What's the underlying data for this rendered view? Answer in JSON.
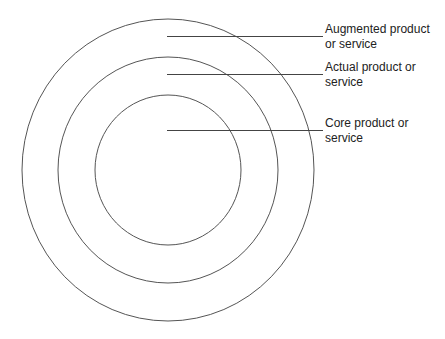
{
  "diagram": {
    "center": {
      "x": 168,
      "y": 170
    },
    "colors": {
      "ring_stroke": "#555555",
      "leader_stroke": "#444444",
      "text": "#222222",
      "background": "#ffffff"
    },
    "rings": [
      {
        "name": "augmented",
        "rx": 146,
        "ry": 151
      },
      {
        "name": "actual",
        "rx": 110,
        "ry": 113
      },
      {
        "name": "core",
        "rx": 73,
        "ry": 75
      }
    ],
    "labels": [
      {
        "id": "augmented",
        "line1": "Augmented product",
        "line2": "or service",
        "leader_y": 36,
        "text_top": 22
      },
      {
        "id": "actual",
        "line1": "Actual product or",
        "line2": "service",
        "leader_y": 74,
        "text_top": 60
      },
      {
        "id": "core",
        "line1": "Core product or",
        "line2": "service",
        "leader_y": 130,
        "text_top": 116
      }
    ],
    "leader_start_x": 167,
    "leader_end_x": 323
  }
}
